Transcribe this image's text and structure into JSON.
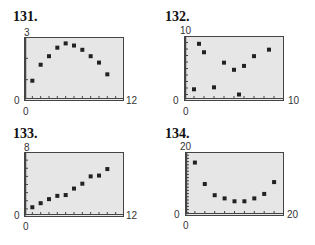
{
  "panels": [
    {
      "label": "131.",
      "ymax_label": "3",
      "ymin_label": "0",
      "xmin_label": "0",
      "xmax_label": "12"
    },
    {
      "label": "132.",
      "ymax_label": "10",
      "ymin_label": "0",
      "xmin_label": "0",
      "xmax_label": "10"
    },
    {
      "label": "133.",
      "ymax_label": "8",
      "ymin_label": "0",
      "xmin_label": "0",
      "xmax_label": "12"
    },
    {
      "label": "134.",
      "ymax_label": "20",
      "ymin_label": "0",
      "xmin_label": "0",
      "xmax_label": "20"
    }
  ],
  "colors": {
    "plot_background": "#e6e6e6",
    "frame": "#444444",
    "marker": "#222222"
  },
  "chart_data": [
    {
      "type": "scatter",
      "title": "131.",
      "xlabel": "",
      "ylabel": "",
      "xlim": [
        0,
        12
      ],
      "ylim": [
        0,
        3
      ],
      "x_ticks": 12,
      "y_ticks": 3,
      "grid": false,
      "legend": null,
      "x": [
        1,
        2,
        3,
        4,
        5,
        6,
        7,
        8,
        9,
        10
      ],
      "y": [
        0.95,
        1.7,
        2.1,
        2.5,
        2.7,
        2.6,
        2.4,
        2.1,
        1.8,
        1.25
      ]
    },
    {
      "type": "scatter",
      "title": "132.",
      "xlabel": "",
      "ylabel": "",
      "xlim": [
        0,
        10
      ],
      "ylim": [
        0,
        10
      ],
      "x_ticks": 10,
      "y_ticks": 10,
      "grid": false,
      "legend": null,
      "x": [
        1.0,
        1.5,
        2.0,
        3.0,
        4.0,
        5.0,
        5.5,
        6.0,
        7.0,
        8.5
      ],
      "y": [
        1.8,
        8.8,
        7.5,
        2.1,
        5.9,
        4.8,
        1.0,
        5.4,
        6.9,
        7.9
      ]
    },
    {
      "type": "scatter",
      "title": "133.",
      "xlabel": "",
      "ylabel": "",
      "xlim": [
        0,
        12
      ],
      "ylim": [
        0,
        8
      ],
      "x_ticks": 12,
      "y_ticks": 8,
      "grid": false,
      "legend": null,
      "x": [
        1,
        2,
        3,
        4,
        5,
        6,
        7,
        8,
        9,
        10
      ],
      "y": [
        1.2,
        1.7,
        2.2,
        2.6,
        2.7,
        3.5,
        4.1,
        5.0,
        5.1,
        5.9
      ]
    },
    {
      "type": "scatter",
      "title": "134.",
      "xlabel": "",
      "ylabel": "",
      "xlim": [
        0,
        20
      ],
      "ylim": [
        0,
        20
      ],
      "x_ticks": 10,
      "y_ticks": 20,
      "grid": false,
      "legend": null,
      "x": [
        2,
        4,
        6,
        8,
        10,
        12,
        14,
        16,
        18
      ],
      "y": [
        16.7,
        10.0,
        6.5,
        5.5,
        4.6,
        4.6,
        5.5,
        6.9,
        10.6
      ]
    }
  ]
}
